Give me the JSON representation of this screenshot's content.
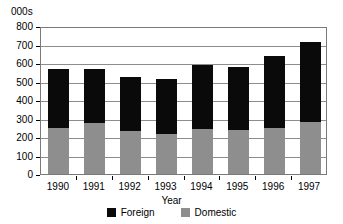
{
  "chart_data": {
    "type": "bar",
    "subtype": "stacked-column",
    "title": "",
    "xlabel": "Year",
    "ylabel": "000s",
    "y_unit_caption": "000s",
    "categories": [
      "1990",
      "1991",
      "1992",
      "1993",
      "1994",
      "1995",
      "1996",
      "1997"
    ],
    "series": [
      {
        "name": "Domestic",
        "color": "#8e8e8e",
        "values": [
          250,
          275,
          230,
          215,
          245,
          240,
          250,
          280
        ]
      },
      {
        "name": "Foreign",
        "color": "#0a0a0a",
        "values": [
          320,
          295,
          295,
          297,
          345,
          340,
          390,
          435
        ]
      }
    ],
    "totals": [
      570,
      570,
      525,
      512,
      590,
      580,
      640,
      715
    ],
    "stack_order": [
      "Domestic",
      "Foreign"
    ],
    "ylim": [
      0,
      800
    ],
    "ytick_values": [
      0,
      100,
      200,
      300,
      400,
      500,
      600,
      700,
      800
    ],
    "ytick_labels": [
      "0",
      "100",
      "200",
      "300",
      "400",
      "500",
      "600",
      "700",
      "800"
    ],
    "grid": true,
    "grid_axis": "y",
    "legend_position": "bottom",
    "legend": [
      {
        "label": "Foreign",
        "color": "#0a0a0a"
      },
      {
        "label": "Domestic",
        "color": "#8e8e8e"
      }
    ]
  }
}
